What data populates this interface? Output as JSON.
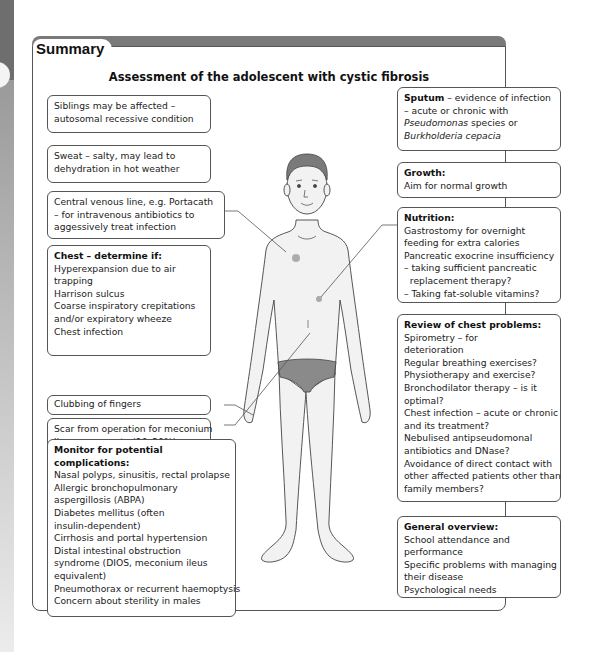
{
  "header": {
    "tab_label": "Summary",
    "title": "Assessment of the adolescent with cystic fibrosis"
  },
  "left_boxes": {
    "siblings": {
      "lines": [
        "Siblings may be affected –",
        "autosomal recessive condition"
      ]
    },
    "sweat": {
      "lines": [
        "Sweat – salty, may lead to",
        "dehydration in hot weather"
      ]
    },
    "central_line": {
      "lines": [
        "Central venous line, e.g. Portacath",
        "– for intravenous antibiotics to",
        "aggessively treat infection"
      ]
    },
    "chest": {
      "heading": "Chest – determine if:",
      "lines": [
        "Hyperexpansion due to air",
        "trapping",
        "Harrison sulcus",
        "Coarse inspiratory crepitations",
        "and/or expiratory wheeze",
        "Chest infection"
      ]
    },
    "clubbing": {
      "lines": [
        "Clubbing of fingers"
      ]
    },
    "scar": {
      "lines": [
        "Scar from operation for meconium",
        "ileus as neonate (10–20%)"
      ]
    },
    "complications": {
      "heading_lines": [
        "Monitor for potential",
        "complications:"
      ],
      "lines": [
        "Nasal polyps, sinusitis, rectal prolapse",
        "Allergic bronchopulmonary",
        "aspergillosis (ABPA)",
        "Diabetes mellitus (often",
        "insulin-dependent)",
        "Cirrhosis and portal hypertension",
        "Distal intestinal obstruction",
        "syndrome (DIOS, meconium ileus",
        "equivalent)",
        "Pneumothorax or recurrent haemoptysis",
        "Concern about sterility in males"
      ]
    }
  },
  "right_boxes": {
    "sputum": {
      "heading": "Sputum",
      "line1_rest": " – evidence of infection",
      "line2": "– acute or chronic with",
      "line3_italic": "Pseudomonas",
      "line3_rest": " species or",
      "line4_italic": "Burkholderia cepacia"
    },
    "growth": {
      "heading": "Growth:",
      "lines": [
        "Aim for normal growth"
      ]
    },
    "nutrition": {
      "heading": "Nutrition:",
      "lines": [
        "Gastrostomy for overnight",
        "feeding for extra calories",
        "Pancreatic exocrine insufficiency",
        "– taking sufficient pancreatic",
        "  replacement therapy?",
        "– Taking fat-soluble vitamins?"
      ]
    },
    "chest_review": {
      "heading": "Review of chest problems:",
      "lines": [
        "Spirometry – for",
        "deterioration",
        "Regular breathing exercises?",
        "Physiotherapy and exercise?",
        "Bronchodilator therapy – is it",
        "optimal?",
        "Chest infection – acute or chronic",
        "and its treatment?",
        "Nebulised antipseudomonal",
        "antibiotics and DNase?",
        "Avoidance of direct contact with",
        "other affected patients other than",
        "family members?"
      ]
    },
    "general": {
      "heading": "General overview:",
      "lines": [
        "School attendance and",
        "performance",
        "Specific problems with managing",
        "their disease",
        "Psychological needs"
      ]
    }
  },
  "figure": {
    "icon": "adolescent-body-outline",
    "skin_color": "#f2f2f2",
    "underwear_color": "#8a8a8a",
    "hair_color": "#7a7a7a",
    "mark_color": "#9a9a9a"
  }
}
